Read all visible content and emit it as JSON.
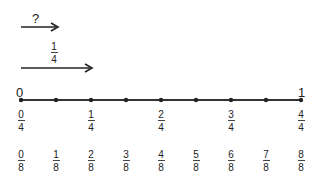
{
  "diagram": {
    "top_arrow": {
      "label": "?",
      "from": 0,
      "to": 0.125
    },
    "second_arrow": {
      "label_num": "1",
      "label_den": "4",
      "from": 0,
      "to": 0.25
    },
    "number_line": {
      "start_label": "0",
      "end_label": "1",
      "tick_count": 9,
      "color": "#333333"
    },
    "quarters": [
      {
        "num": "0",
        "den": "4"
      },
      {
        "num": "1",
        "den": "4"
      },
      {
        "num": "2",
        "den": "4"
      },
      {
        "num": "3",
        "den": "4"
      },
      {
        "num": "4",
        "den": "4"
      }
    ],
    "eighths": [
      {
        "num": "0",
        "den": "8"
      },
      {
        "num": "1",
        "den": "8"
      },
      {
        "num": "2",
        "den": "8"
      },
      {
        "num": "3",
        "den": "8"
      },
      {
        "num": "4",
        "den": "8"
      },
      {
        "num": "5",
        "den": "8"
      },
      {
        "num": "6",
        "den": "8"
      },
      {
        "num": "7",
        "den": "8"
      },
      {
        "num": "8",
        "den": "8"
      }
    ]
  }
}
